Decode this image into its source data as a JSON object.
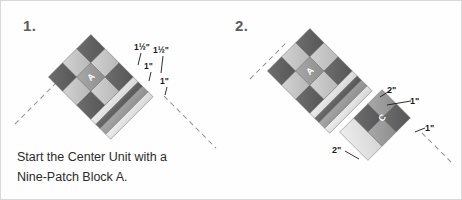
{
  "document": {
    "title": "Quilt Center Unit Assembly Diagram",
    "background_color": "#ffffff",
    "border_color": "#d8d8d8"
  },
  "caption": {
    "line1": "Start the Center Unit with a",
    "line2": "Nine-Patch Block A."
  },
  "palette": {
    "dark": "#5f5f5f",
    "mid_dark": "#787878",
    "mid": "#9a9a9a",
    "light": "#c3c3c3",
    "lighter": "#d7d7d7",
    "very_light": "#e8e8e8",
    "outline": "#6f6f6f",
    "label_text": "#1a1a1a",
    "step_text": "#5d5d5d",
    "caption_text": "#2b2b2b",
    "guide_line": "#9a9a9a"
  },
  "panels": [
    {
      "id": "panel-1",
      "step_number": "1.",
      "block_letter": "A",
      "dimension_labels": [
        {
          "id": "p1-dim-a",
          "text": "1½\"",
          "x": 133,
          "y": 49
        },
        {
          "id": "p1-dim-b",
          "text": "1½\"",
          "x": 156,
          "y": 52
        },
        {
          "id": "p1-dim-c",
          "text": "1\"",
          "x": 146,
          "y": 68
        },
        {
          "id": "p1-dim-d",
          "text": "1\"",
          "x": 161,
          "y": 83
        }
      ]
    },
    {
      "id": "panel-2",
      "step_number": "2.",
      "block_letter_a": "A",
      "block_letter_c": "C",
      "dimension_labels": [
        {
          "id": "p2-dim-a",
          "text": "2\"",
          "x": 160,
          "y": 92
        },
        {
          "id": "p2-dim-b",
          "text": "1\"",
          "x": 181,
          "y": 103
        },
        {
          "id": "p2-dim-c",
          "text": "1\"",
          "x": 195,
          "y": 130
        },
        {
          "id": "p2-dim-d",
          "text": "2\"",
          "x": 104,
          "y": 152
        }
      ]
    }
  ]
}
